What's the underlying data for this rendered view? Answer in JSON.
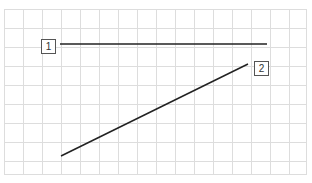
{
  "grid": {
    "left": 4,
    "top": 9,
    "right": 306,
    "bottom": 174,
    "spacing": 19,
    "color": "#dddddd"
  },
  "lines": [
    {
      "id": "1",
      "x1": 60,
      "y1": 44,
      "x2": 267,
      "y2": 44,
      "color": "#222222"
    },
    {
      "id": "2",
      "x1": 61,
      "y1": 156,
      "x2": 248,
      "y2": 64,
      "color": "#222222"
    }
  ],
  "labels": [
    {
      "text": "1",
      "x": 41,
      "y": 39
    },
    {
      "text": "2",
      "x": 254,
      "y": 61
    }
  ]
}
